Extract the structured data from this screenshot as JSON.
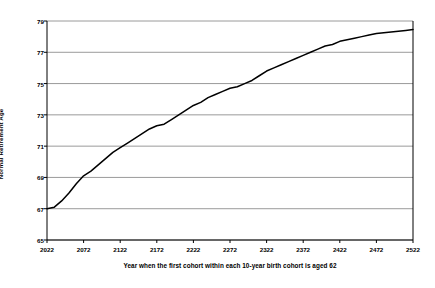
{
  "chart_data": {
    "type": "line",
    "title": "",
    "xlabel": "Year when the first cohort within each 10-year birth cohort is aged 62",
    "ylabel": "Normal Retirement Age",
    "xlim": [
      2022,
      2522
    ],
    "ylim": [
      65,
      79
    ],
    "grid": true,
    "legend": "none",
    "xticks": [
      "2022",
      "2072",
      "2122",
      "2172",
      "2222",
      "2272",
      "2322",
      "2372",
      "2422",
      "2472",
      "2522"
    ],
    "yticks": [
      "65",
      "67",
      "69",
      "71",
      "73",
      "75",
      "77",
      "79"
    ],
    "line_color": "#000000",
    "grid_color": "#808080",
    "axis_color": "#000000",
    "series": [
      {
        "name": "Normal Retirement Age",
        "x": [
          2022,
          2032,
          2042,
          2052,
          2062,
          2072,
          2082,
          2092,
          2102,
          2112,
          2122,
          2132,
          2142,
          2152,
          2162,
          2172,
          2182,
          2192,
          2202,
          2212,
          2222,
          2232,
          2242,
          2252,
          2262,
          2272,
          2282,
          2292,
          2302,
          2312,
          2322,
          2332,
          2342,
          2352,
          2362,
          2372,
          2382,
          2392,
          2402,
          2412,
          2422,
          2432,
          2442,
          2452,
          2462,
          2472,
          2482,
          2492,
          2502,
          2512,
          2522
        ],
        "values": [
          67.0,
          67.1,
          67.5,
          68.0,
          68.6,
          69.1,
          69.4,
          69.8,
          70.2,
          70.6,
          70.9,
          71.2,
          71.5,
          71.8,
          72.1,
          72.3,
          72.4,
          72.7,
          73.0,
          73.3,
          73.6,
          73.8,
          74.1,
          74.3,
          74.5,
          74.7,
          74.8,
          75.0,
          75.2,
          75.5,
          75.8,
          76.0,
          76.2,
          76.4,
          76.6,
          76.8,
          77.0,
          77.2,
          77.4,
          77.5,
          77.7,
          77.8,
          77.9,
          78.0,
          78.1,
          78.2,
          78.25,
          78.3,
          78.35,
          78.4,
          78.45
        ]
      }
    ]
  }
}
